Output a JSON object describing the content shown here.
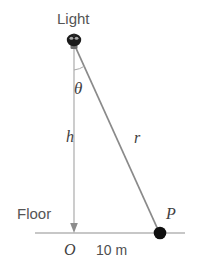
{
  "figure": {
    "type": "geometry-diagram",
    "background_color": "#ffffff",
    "line_color": "#8a8a8a",
    "marker_color": "#111111",
    "text_color": "#4a4a4a"
  },
  "labels": {
    "light": "Light",
    "floor": "Floor",
    "theta": "θ",
    "height": "h",
    "radius": "r",
    "origin": "O",
    "point": "P",
    "distance": "10 m"
  },
  "geometry": {
    "light_position": {
      "x": 74,
      "y": 44
    },
    "origin_position": {
      "x": 74,
      "y": 233
    },
    "point_p_position": {
      "x": 160,
      "y": 233
    },
    "floor_line": {
      "x1": 35,
      "y1": 233,
      "x2": 185,
      "y2": 233
    },
    "height_line": {
      "x1": 74,
      "y1": 48,
      "x2": 74,
      "y2": 233
    },
    "hypotenuse_line": {
      "x1": 75,
      "y1": 46,
      "x2": 159,
      "y2": 232
    },
    "angle_arc_radius": 22
  },
  "icons": {
    "light_fixture": "light-bulb-icon",
    "height_arrow": "down-arrow-icon",
    "point_marker": "filled-circle-icon"
  }
}
